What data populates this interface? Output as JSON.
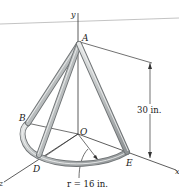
{
  "figure": {
    "type": "engineering-mechanics-3d-sketch",
    "axes": {
      "y": "y",
      "x": "x",
      "z": "z"
    },
    "points": {
      "A": "A",
      "B": "B",
      "O": "O",
      "D": "D",
      "E": "E"
    },
    "dimensions": {
      "height": "30 in.",
      "radius": "r = 16 in."
    },
    "colors": {
      "rod_fill": "#c9cccd",
      "rod_edge": "#6f7375",
      "line": "#333333",
      "text": "#1a1a1a",
      "background": "#ffffff"
    }
  }
}
